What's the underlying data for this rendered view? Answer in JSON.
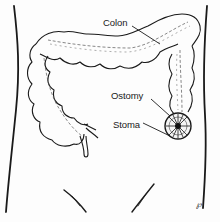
{
  "figure": {
    "labels": {
      "colon": "Colon",
      "ostomy": "Ostomy",
      "stoma": "Stoma"
    },
    "signature": "℘",
    "colors": {
      "ink": "#1a1a1a",
      "shading": "#8a8a8a",
      "background": "#fdfdfd"
    }
  }
}
